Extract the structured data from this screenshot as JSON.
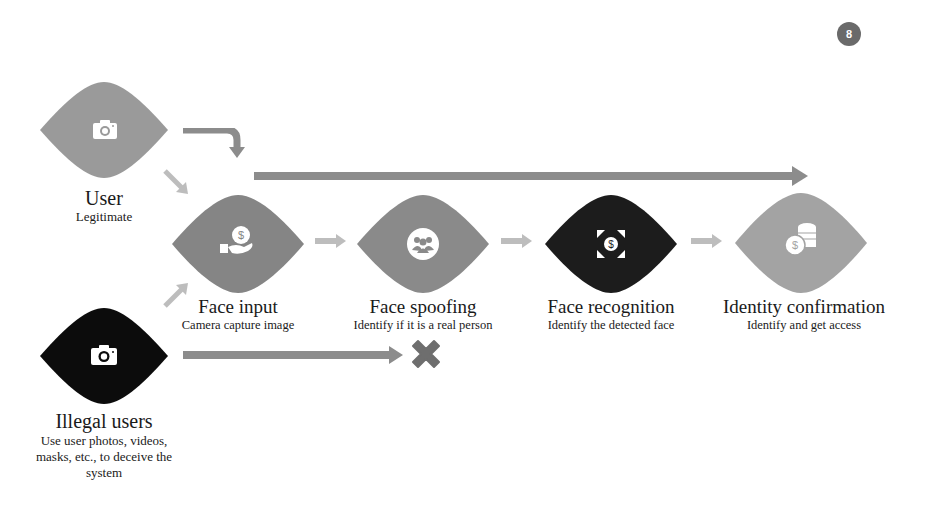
{
  "page_number": "8",
  "colors": {
    "light_gray": "#9a9a9a",
    "mid_gray": "#858585",
    "dark": "#1c1c1c",
    "arrow_gray": "#8c8c8c",
    "arrow_light": "#bdbdbd",
    "cross": "#6e6e6e"
  },
  "actors": {
    "user": {
      "title": "User",
      "subtitle": "Legitimate",
      "icon": "camera-icon"
    },
    "illegal": {
      "title": "Illegal users",
      "subtitle_lines": [
        "Use user photos, videos,",
        "masks, etc., to deceive the",
        "system"
      ],
      "icon": "camera-icon"
    }
  },
  "steps": [
    {
      "title": "Face input",
      "subtitle": "Camera capture image",
      "icon": "hand-money-icon"
    },
    {
      "title": "Face spoofing",
      "subtitle": "Identify if it is a real person",
      "icon": "group-icon"
    },
    {
      "title": "Face recognition",
      "subtitle": "Identify the detected face",
      "icon": "money-expand-icon"
    },
    {
      "title": "Identity confirmation",
      "subtitle": "Identify and get access",
      "icon": "coins-icon"
    }
  ],
  "blocked_marker": "cross-icon"
}
